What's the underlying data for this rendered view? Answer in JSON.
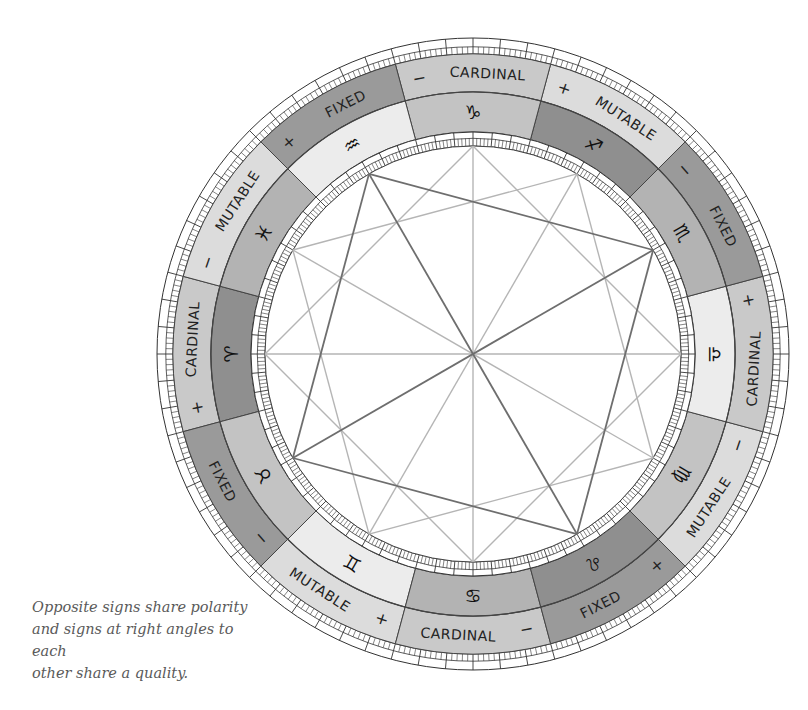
{
  "caption": {
    "line1": "Opposite signs share polarity",
    "line2": "and signs at right angles to each",
    "line3": "other share a quality."
  },
  "wheel": {
    "center": [
      473,
      354
    ],
    "radii": {
      "chart": 208,
      "inner_ticks_outer": 222,
      "sign_ring_outer": 262,
      "quality_ring_outer": 300,
      "outer_ticks_outer": 316
    },
    "element_colors": {
      "fire": "#8f8f8f",
      "earth": "#c3c3c3",
      "air": "#ececec",
      "water": "#b3b3b3"
    },
    "quality_colors": {
      "CARDINAL": "#c9c9c9",
      "FIXED": "#9a9a9a",
      "MUTABLE": "#dcdcdc"
    },
    "signs": [
      {
        "name": "aries",
        "glyph": "♈",
        "element": "fire",
        "quality": "CARDINAL",
        "polarity": "+"
      },
      {
        "name": "taurus",
        "glyph": "♉",
        "element": "earth",
        "quality": "FIXED",
        "polarity": "−"
      },
      {
        "name": "gemini",
        "glyph": "♊",
        "element": "air",
        "quality": "MUTABLE",
        "polarity": "+"
      },
      {
        "name": "cancer",
        "glyph": "♋",
        "element": "water",
        "quality": "CARDINAL",
        "polarity": "−"
      },
      {
        "name": "leo",
        "glyph": "♌",
        "element": "fire",
        "quality": "FIXED",
        "polarity": "+"
      },
      {
        "name": "virgo",
        "glyph": "♍",
        "element": "earth",
        "quality": "MUTABLE",
        "polarity": "−"
      },
      {
        "name": "libra",
        "glyph": "♎",
        "element": "air",
        "quality": "CARDINAL",
        "polarity": "+"
      },
      {
        "name": "scorpio",
        "glyph": "♏",
        "element": "water",
        "quality": "FIXED",
        "polarity": "−"
      },
      {
        "name": "sagittarius",
        "glyph": "♐",
        "element": "fire",
        "quality": "MUTABLE",
        "polarity": "+"
      },
      {
        "name": "capricorn",
        "glyph": "♑",
        "element": "earth",
        "quality": "CARDINAL",
        "polarity": "−"
      },
      {
        "name": "aquarius",
        "glyph": "♒",
        "element": "air",
        "quality": "FIXED",
        "polarity": "+"
      },
      {
        "name": "pisces",
        "glyph": "♓",
        "element": "water",
        "quality": "MUTABLE",
        "polarity": "−"
      }
    ],
    "aspect_lines": {
      "dark_squares": [
        [
          1,
          4,
          7,
          10
        ]
      ],
      "light_squares": [
        [
          0,
          3,
          6,
          9
        ],
        [
          2,
          5,
          8,
          11
        ]
      ],
      "dark_oppositions": [
        [
          1,
          7
        ],
        [
          4,
          10
        ]
      ],
      "light_oppositions": [
        [
          0,
          6
        ],
        [
          3,
          9
        ],
        [
          2,
          8
        ],
        [
          5,
          11
        ]
      ]
    }
  }
}
